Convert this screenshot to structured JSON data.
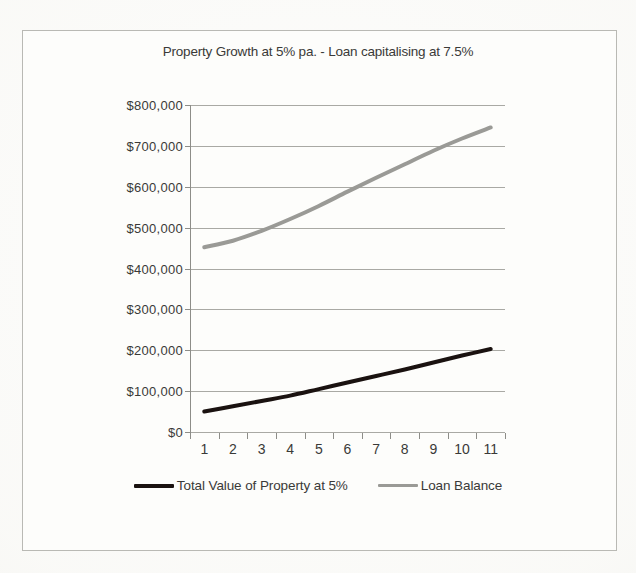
{
  "figure": {
    "background_color": "#fbfbf9",
    "frame_color": "#b9b9b4"
  },
  "chart_data": {
    "type": "line",
    "title": "Property Growth at 5% pa. - Loan capitalising at 7.5%",
    "xlabel": "",
    "ylabel": "",
    "grid": true,
    "legend_position": "bottom",
    "x": [
      1,
      2,
      3,
      4,
      5,
      6,
      7,
      8,
      9,
      10,
      11
    ],
    "categories": [
      "1",
      "2",
      "3",
      "4",
      "5",
      "6",
      "7",
      "8",
      "9",
      "10",
      "11"
    ],
    "ylim": [
      0,
      800000
    ],
    "ytick_values": [
      0,
      100000,
      200000,
      300000,
      400000,
      500000,
      600000,
      700000,
      800000
    ],
    "ytick_labels": [
      "$0",
      "$100,000",
      "$200,000",
      "$300,000",
      "$400,000",
      "$500,000",
      "$600,000",
      "$700,000",
      "$800,000"
    ],
    "series": [
      {
        "name": "Total Value of Property at 5%",
        "color": "#1a1210",
        "line_width": 4,
        "values": [
          50000,
          63000,
          76000,
          89000,
          105000,
          121000,
          137000,
          153000,
          170000,
          187000,
          203000
        ]
      },
      {
        "name": "Loan Balance",
        "color": "#9a9a96",
        "line_width": 4,
        "values": [
          452000,
          468000,
          492000,
          521000,
          553000,
          588000,
          622000,
          655000,
          688000,
          718000,
          745000
        ]
      }
    ]
  },
  "legend": {
    "items": [
      {
        "label": "Total Value of Property at 5%",
        "color": "#1a1210"
      },
      {
        "label": "Loan Balance",
        "color": "#9a9a96"
      }
    ]
  }
}
